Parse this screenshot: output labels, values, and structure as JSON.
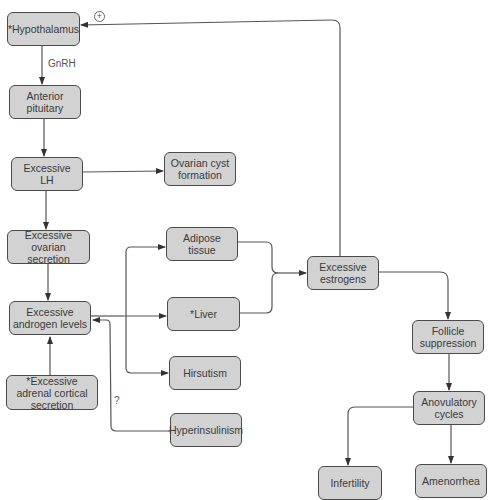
{
  "nodes": {
    "hypothalamus": "*Hypothalamus",
    "anterior_pituitary": "Anterior pituitary",
    "excessive_lh": "Excessive LH",
    "ovarian_cyst": "Ovarian cyst formation",
    "ovarian_secretion": "Excessive ovarian secretion",
    "adipose": "Adipose tissue",
    "androgen": "Excessive androgen levels",
    "liver": "*Liver",
    "hirsutism": "Hirsutism",
    "adrenal": "*Excessive adrenal cortical secretion",
    "hyperinsulinism": "Hyperinsulinism",
    "estrogens": "Excessive estrogens",
    "follicle": "Follicle suppression",
    "anovulatory": "Anovulatory cycles",
    "infertility": "Infertility",
    "amenorrhea": "Amenorrhea"
  },
  "edge_labels": {
    "gnrh": "GnRH",
    "question": "?",
    "positive_feedback": "+"
  },
  "colors": {
    "node_fill": "#d2d2d2",
    "node_border": "#4a4a4a",
    "line": "#444444"
  }
}
